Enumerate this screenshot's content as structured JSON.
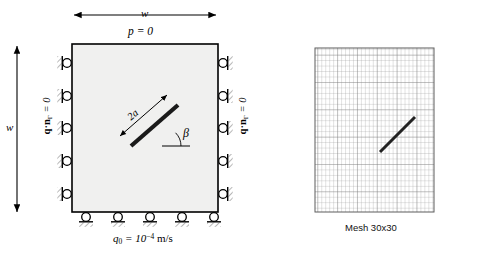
{
  "figure": {
    "colors": {
      "line": "#000000",
      "panel_fill": "#f0f0ef",
      "crack": "#1a1a1a",
      "mesh_line": "#9a9a9a",
      "mesh_line_major": "#6e6e6e",
      "mesh_border": "#555555",
      "hatch": "#555555"
    }
  },
  "panel": {
    "top_dimension_label": "w",
    "left_dimension_label": "w",
    "top_boundary_label": "p = 0",
    "left_boundary_label": "q·n",
    "left_boundary_sub": "Γ",
    "left_boundary_eq": " = 0",
    "right_boundary_label": "q·n",
    "right_boundary_sub": "Γ",
    "right_boundary_eq": " = 0",
    "bottom_flux_symbol": "q",
    "bottom_flux_sub": "0",
    "bottom_flux_eq": " = 10",
    "bottom_flux_exp": "−4",
    "bottom_flux_units": " m/s",
    "crack_length_label": "2a",
    "crack_angle_label": "β",
    "roller_count_left": 5,
    "roller_count_right": 5,
    "roller_count_bottom": 5
  },
  "mesh": {
    "caption": "Mesh 30x30",
    "divisions": 30,
    "crack_visible": true
  }
}
